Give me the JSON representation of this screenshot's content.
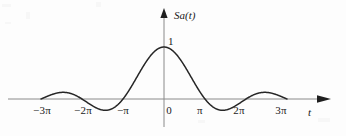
{
  "chart_data": {
    "type": "line",
    "title": "",
    "subtitle": "",
    "xlabel": "t",
    "ylabel": "Sa(t)",
    "function": "Sa(t) = sin(t)/t",
    "grid": false,
    "legend": null,
    "xlim": [
      -10.9956,
      10.9956
    ],
    "ylim": [
      -0.25,
      1.12
    ],
    "x_tick_labels": [
      "−3π",
      "−2π",
      "−π",
      "0",
      "π",
      "2π",
      "3π"
    ],
    "x_tick_values": [
      -9.4248,
      -6.2832,
      -3.1416,
      0,
      3.1416,
      6.2832,
      9.4248
    ],
    "y_tick_labels": [
      "1"
    ],
    "y_tick_values": [
      1
    ],
    "annotations": [
      {
        "text": "1",
        "x": 0,
        "y": 1,
        "note": "peak value label at main lobe"
      },
      {
        "text": "Sa(t)",
        "note": "vertical axis name at arrow tip"
      },
      {
        "text": "t",
        "note": "horizontal axis name at arrow tip"
      }
    ],
    "series": [
      {
        "name": "Sa(t)",
        "color": "#262626",
        "x": [
          -9.4248,
          -9.1106,
          -8.7965,
          -8.4823,
          -8.1681,
          -7.854,
          -7.5398,
          -7.2257,
          -6.9115,
          -6.5973,
          -6.2832,
          -5.969,
          -5.6549,
          -5.3407,
          -5.0265,
          -4.7124,
          -4.3982,
          -4.0841,
          -3.7699,
          -3.4558,
          -3.1416,
          -2.8274,
          -2.5133,
          -2.1991,
          -1.885,
          -1.5708,
          -1.2566,
          -0.9425,
          -0.6283,
          -0.3142,
          0,
          0.3142,
          0.6283,
          0.9425,
          1.2566,
          1.5708,
          1.885,
          2.1991,
          2.5133,
          2.8274,
          3.1416,
          3.4558,
          3.7699,
          4.0841,
          4.3982,
          4.7124,
          5.0265,
          5.3407,
          5.6549,
          5.969,
          6.2832,
          6.5973,
          6.9115,
          7.2257,
          7.5398,
          7.854,
          8.1681,
          8.4823,
          8.7965,
          9.1106,
          9.4248
        ],
        "y": [
          0,
          0.0336,
          0.0646,
          0.0903,
          0.1083,
          0.1168,
          0.115,
          0.1032,
          0.0827,
          0.0458,
          0,
          -0.0515,
          -0.1012,
          -0.1436,
          -0.1738,
          -0.1885,
          -0.1857,
          -0.1654,
          -0.129,
          -0.0797,
          0,
          0.1042,
          0.2268,
          0.3606,
          0.5046,
          0.6366,
          0.7589,
          0.8589,
          0.9355,
          0.9836,
          1,
          0.9836,
          0.9355,
          0.8589,
          0.7589,
          0.6366,
          0.5046,
          0.3606,
          0.2268,
          0.1042,
          0,
          -0.0797,
          -0.129,
          -0.1654,
          -0.1857,
          -0.1885,
          -0.1738,
          -0.1436,
          -0.1012,
          -0.0515,
          0,
          0.0458,
          0.0827,
          0.1032,
          0.115,
          0.1168,
          0.1083,
          0.0903,
          0.0646,
          0.0336,
          0
        ]
      }
    ],
    "zero_crossings": [
      -9.4248,
      -6.2832,
      -3.1416,
      3.1416,
      6.2832,
      9.4248
    ],
    "peaks": [
      {
        "x": 0,
        "y": 1.0,
        "label": "main lobe"
      },
      {
        "x": -7.7253,
        "y": 0.1284,
        "label": "left second sidelobe"
      },
      {
        "x": -4.4934,
        "y": -0.2172,
        "label": "left first sidelobe (negative)"
      },
      {
        "x": 4.4934,
        "y": -0.2172,
        "label": "right first sidelobe (negative)"
      },
      {
        "x": 7.7253,
        "y": 0.1284,
        "label": "right second sidelobe"
      }
    ]
  },
  "figure": {
    "background_color": "#fdfdfd",
    "curve_color": "#262626",
    "axis_color": "#8a8a8a",
    "text_color": "#1a1a1a"
  },
  "labels": {
    "y_axis_name": "Sa(t)",
    "x_axis_name": "t",
    "peak_value": "1",
    "ticks": {
      "neg3pi": "−3π",
      "neg2pi": "−2π",
      "negpi": "−π",
      "zero": "0",
      "pi": "π",
      "pi2": "2π",
      "pi3": "3π"
    }
  }
}
